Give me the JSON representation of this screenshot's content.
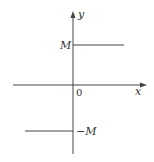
{
  "diagram": {
    "type": "step-function-graph",
    "axes": {
      "x_label": "x",
      "y_label": "y",
      "origin_label": "0"
    },
    "levels": {
      "upper_label": "M",
      "lower_label": "−M"
    },
    "colors": {
      "line": "#444444",
      "text": "#333333",
      "background": "#ffffff"
    }
  }
}
